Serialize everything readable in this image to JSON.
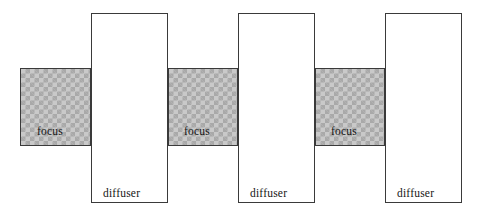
{
  "figure": {
    "type": "schematic-diagram",
    "width": 481,
    "height": 220,
    "background_color": "#ffffff"
  },
  "style": {
    "band_fill_light": "#c9c9c9",
    "band_fill_dark": "#a9a9a9",
    "column_fill": "#ffffff",
    "stroke_color": "#3a3a3a",
    "text_color": "#151515"
  },
  "bands": [
    {
      "label": "focus",
      "x": 20,
      "y": 68,
      "width": 71,
      "height": 78,
      "label_x": 37,
      "label_y": 126
    },
    {
      "label": "focus",
      "x": 168,
      "y": 68,
      "width": 70,
      "height": 78,
      "label_x": 184,
      "label_y": 126
    },
    {
      "label": "focus",
      "x": 315,
      "y": 68,
      "width": 70,
      "height": 78,
      "label_x": 331,
      "label_y": 126
    }
  ],
  "columns": [
    {
      "label": "diffuser",
      "x": 91,
      "y": 13,
      "width": 77,
      "height": 190,
      "label_x": 103,
      "label_y": 188
    },
    {
      "label": "diffuser",
      "x": 238,
      "y": 13,
      "width": 77,
      "height": 190,
      "label_x": 250,
      "label_y": 188
    },
    {
      "label": "diffuser",
      "x": 385,
      "y": 13,
      "width": 77,
      "height": 190,
      "label_x": 397,
      "label_y": 188
    }
  ]
}
